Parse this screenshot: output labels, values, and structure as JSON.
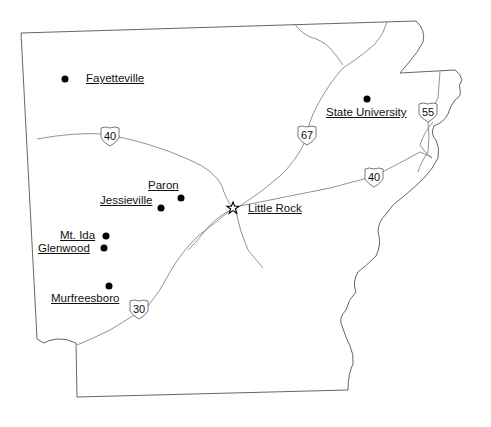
{
  "map": {
    "title": "Arkansas",
    "colors": {
      "border": "#555555",
      "road": "#777777",
      "text": "#111111",
      "dot": "#000000"
    },
    "cities": [
      {
        "name": "Fayetteville",
        "x": 65,
        "y": 79,
        "label_x": 86,
        "label_y": 73
      },
      {
        "name": "State University",
        "x": 367,
        "y": 99,
        "label_x": 326,
        "label_y": 107
      },
      {
        "name": "Paron",
        "x": 181,
        "y": 198,
        "label_x": 148,
        "label_y": 180
      },
      {
        "name": "Jessieville",
        "x": 161,
        "y": 208,
        "label_x": 100,
        "label_y": 195
      },
      {
        "name": "Mt. Ida",
        "x": 106,
        "y": 236,
        "label_x": 60,
        "label_y": 230
      },
      {
        "name": "Glenwood",
        "x": 104,
        "y": 248,
        "label_x": 38,
        "label_y": 243
      },
      {
        "name": "Murfreesboro",
        "x": 109,
        "y": 286,
        "label_x": 51,
        "label_y": 293
      }
    ],
    "capital": {
      "name": "Little Rock",
      "icon": "star-icon",
      "x": 233,
      "y": 208,
      "label_x": 248,
      "label_y": 203
    },
    "highways": [
      {
        "number": "40",
        "x": 110,
        "y": 136
      },
      {
        "number": "67",
        "x": 307,
        "y": 135
      },
      {
        "number": "55",
        "x": 428,
        "y": 112
      },
      {
        "number": "40",
        "x": 374,
        "y": 177
      },
      {
        "number": "30",
        "x": 139,
        "y": 309
      }
    ]
  }
}
